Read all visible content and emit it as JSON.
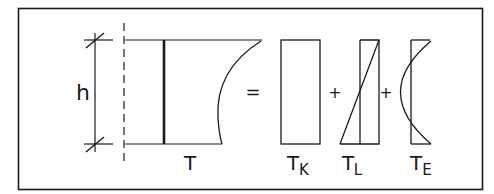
{
  "diagram": {
    "dimension_label": "h",
    "main_label": "T",
    "equals_sign": "=",
    "plus_sign_1": "+",
    "plus_sign_2": "+",
    "components": [
      {
        "base": "T",
        "subscript": "K",
        "shape": "rectangle"
      },
      {
        "base": "T",
        "subscript": "L",
        "shape": "linear-triangle"
      },
      {
        "base": "T",
        "subscript": "E",
        "shape": "parabolic-arc"
      }
    ],
    "colors": {
      "stroke": "#1a1a1a",
      "background": "#ffffff"
    }
  }
}
